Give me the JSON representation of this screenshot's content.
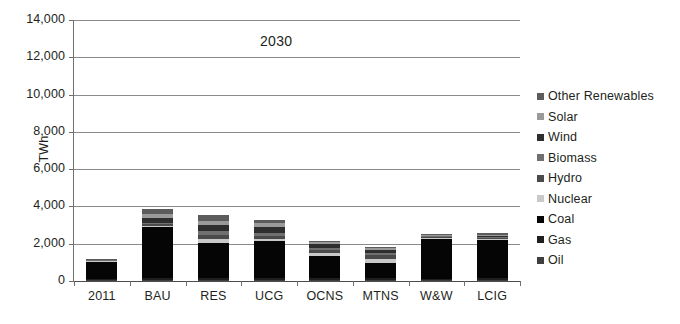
{
  "chart_data": {
    "type": "bar",
    "subtype": "stacked-bar",
    "title": "2030",
    "xlabel": "",
    "ylabel": "TWh",
    "ylim": [
      0,
      14000
    ],
    "ytick_step": 2000,
    "ytick_labels": [
      "0",
      "2,000",
      "4,000",
      "6,000",
      "8,000",
      "10,000",
      "12,000",
      "14,000"
    ],
    "ytick_values": [
      0,
      2000,
      4000,
      6000,
      8000,
      10000,
      12000,
      14000
    ],
    "grid": "horizontal",
    "legend_position": "right",
    "categories": [
      "2011",
      "BAU",
      "RES",
      "UCG",
      "OCNS",
      "MTNS",
      "W&W",
      "LCIG"
    ],
    "series": [
      {
        "name": "Oil",
        "color": "#3f3f3f",
        "values": [
          40,
          40,
          60,
          45,
          40,
          45,
          35,
          40
        ]
      },
      {
        "name": "Gas",
        "color": "#1f1f1f",
        "values": [
          90,
          120,
          110,
          105,
          110,
          100,
          95,
          100
        ]
      },
      {
        "name": "Coal",
        "color": "#050505",
        "values": [
          880,
          2740,
          1880,
          2000,
          1200,
          800,
          2120,
          2060
        ]
      },
      {
        "name": "Nuclear",
        "color": "#c9c9c9",
        "values": [
          40,
          60,
          180,
          100,
          130,
          230,
          50,
          50
        ]
      },
      {
        "name": "Hydro",
        "color": "#4a4a4a",
        "values": [
          50,
          90,
          230,
          180,
          170,
          200,
          60,
          70
        ]
      },
      {
        "name": "Biomass",
        "color": "#707070",
        "values": [
          20,
          80,
          200,
          170,
          130,
          140,
          40,
          50
        ]
      },
      {
        "name": "Wind",
        "color": "#2e2e2e",
        "values": [
          15,
          260,
          330,
          320,
          180,
          130,
          35,
          60
        ]
      },
      {
        "name": "Solar",
        "color": "#9a9a9a",
        "values": [
          8,
          180,
          250,
          190,
          110,
          110,
          30,
          60
        ]
      },
      {
        "name": "Other Renewables",
        "color": "#5c5c5c",
        "values": [
          7,
          280,
          310,
          140,
          80,
          45,
          35,
          60
        ]
      }
    ],
    "totals": [
      1150,
      3850,
      3550,
      3250,
      2150,
      1800,
      2500,
      2550
    ],
    "units": "TWh"
  },
  "legend": {
    "items": [
      {
        "label": "Other Renewables",
        "color": "#5c5c5c"
      },
      {
        "label": "Solar",
        "color": "#9a9a9a"
      },
      {
        "label": "Wind",
        "color": "#2e2e2e"
      },
      {
        "label": "Biomass",
        "color": "#707070"
      },
      {
        "label": "Hydro",
        "color": "#4a4a4a"
      },
      {
        "label": "Nuclear",
        "color": "#c9c9c9"
      },
      {
        "label": "Coal",
        "color": "#050505"
      },
      {
        "label": "Gas",
        "color": "#1f1f1f"
      },
      {
        "label": "Oil",
        "color": "#3f3f3f"
      }
    ]
  },
  "axis": {
    "y_title": "TWh"
  },
  "colors": {
    "background": "#ffffff",
    "text": "#231f20",
    "gridline": "#8a8a8a",
    "axis": "#6f6f6f"
  }
}
